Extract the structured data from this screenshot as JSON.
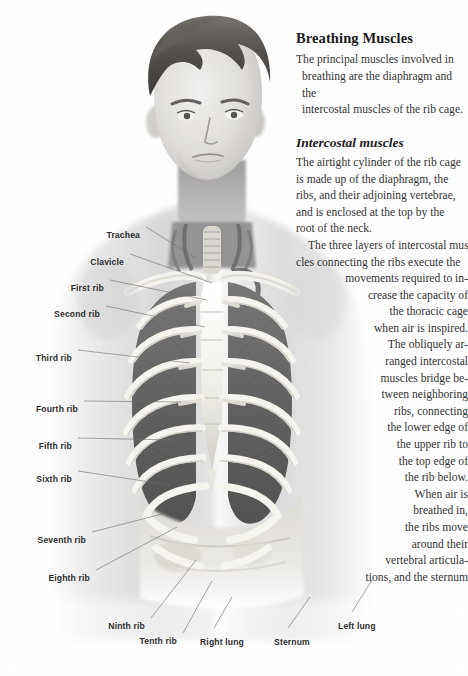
{
  "page": {
    "width": 468,
    "height": 676,
    "background": "#fefefe",
    "text_color": "#333333",
    "label_color": "#2e2e2e",
    "leader_color": "#6d6d6d"
  },
  "article": {
    "heading": "Breathing Muscles",
    "intro_lines": [
      "The principal muscles involved in",
      "breathing are the diaphragm and the",
      "intercostal muscles of the rib cage."
    ],
    "subheading": "Intercostal muscles",
    "body_lines": [
      "The airtight cylinder of the rib cage",
      "is made up of the diaphragm, the",
      "ribs, and their adjoining vertebrae,",
      "and is enclosed at the top by the",
      "root of the neck.",
      "The three layers of intercostal mus-",
      "cles connecting the ribs execute the",
      "movements required to in-",
      "crease the capacity of",
      "the thoracic cage",
      "when air is inspired.",
      "The obliquely ar-",
      "ranged intercostal",
      "muscles bridge be-",
      "tween neighboring",
      "ribs, connecting",
      "the lower edge of",
      "the upper rib to",
      "the top edge of",
      "the rib below.",
      "When air is",
      "breathed in,",
      "the ribs move",
      "around their",
      "vertebral articula-",
      "tions, and the sternum"
    ]
  },
  "labels": [
    {
      "text": "Trachea",
      "x": 140,
      "y": 230,
      "align": "right",
      "line": [
        [
          146,
          227
        ],
        [
          196,
          258
        ]
      ]
    },
    {
      "text": "Clavicle",
      "x": 124,
      "y": 257,
      "align": "right",
      "line": [
        [
          130,
          254
        ],
        [
          212,
          283
        ]
      ]
    },
    {
      "text": "First rib",
      "x": 104,
      "y": 283,
      "align": "right",
      "line": [
        [
          110,
          280
        ],
        [
          207,
          300
        ]
      ]
    },
    {
      "text": "Second rib",
      "x": 100,
      "y": 309,
      "align": "right",
      "line": [
        [
          106,
          306
        ],
        [
          205,
          327
        ]
      ]
    },
    {
      "text": "Third rib",
      "x": 72,
      "y": 353,
      "align": "right",
      "line": [
        [
          78,
          350
        ],
        [
          190,
          363
        ]
      ]
    },
    {
      "text": "Fourth rib",
      "x": 78,
      "y": 404,
      "align": "right",
      "line": [
        [
          84,
          401
        ],
        [
          181,
          402
        ]
      ]
    },
    {
      "text": "Fifth rib",
      "x": 72,
      "y": 441,
      "align": "right",
      "line": [
        [
          78,
          438
        ],
        [
          174,
          440
        ]
      ]
    },
    {
      "text": "Sixth rib",
      "x": 72,
      "y": 474,
      "align": "right",
      "line": [
        [
          78,
          471
        ],
        [
          170,
          485
        ]
      ]
    },
    {
      "text": "Seventh rib",
      "x": 86,
      "y": 535,
      "align": "right",
      "line": [
        [
          92,
          532
        ],
        [
          166,
          513
        ]
      ]
    },
    {
      "text": "Eighth rib",
      "x": 90,
      "y": 573,
      "align": "right",
      "line": [
        [
          96,
          570
        ],
        [
          177,
          527
        ]
      ]
    },
    {
      "text": "Ninth rib",
      "x": 145,
      "y": 621,
      "align": "right",
      "line": [
        [
          151,
          618
        ],
        [
          196,
          560
        ]
      ]
    },
    {
      "text": "Tenth rib",
      "x": 177,
      "y": 636,
      "align": "right",
      "line": [
        [
          183,
          633
        ],
        [
          212,
          581
        ]
      ]
    },
    {
      "text": "Right lung",
      "x": 200,
      "y": 637,
      "align": "left",
      "line": [
        [
          214,
          628
        ],
        [
          232,
          597
        ]
      ]
    },
    {
      "text": "Sternum",
      "x": 274,
      "y": 637,
      "align": "left",
      "line": [
        [
          288,
          628
        ],
        [
          310,
          597
        ]
      ]
    },
    {
      "text": "Left lung",
      "x": 338,
      "y": 621,
      "align": "left",
      "line": [
        [
          352,
          612
        ],
        [
          372,
          580
        ]
      ]
    }
  ],
  "figure": {
    "name": "male-thorax-ribcage-illustration"
  }
}
